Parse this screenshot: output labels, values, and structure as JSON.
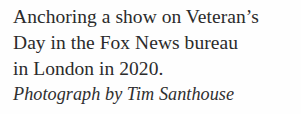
{
  "caption": {
    "lines": [
      "Anchoring a show on Veteran’s",
      "Day in the Fox News bureau",
      "in London in 2020."
    ],
    "full_text": "Anchoring a show on Veteran’s Day in the Fox News bureau in London in 2020.",
    "credit": "Photograph by Tim Santhouse"
  },
  "colors": {
    "background": "#fefefe",
    "body_text": "#2b2b2b",
    "credit_text": "#2f2f2f"
  }
}
